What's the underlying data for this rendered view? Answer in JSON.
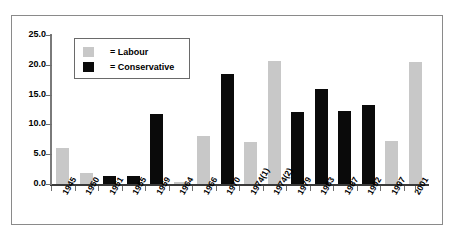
{
  "chart_data": {
    "type": "bar",
    "title": "",
    "subtitle": "",
    "xlabel": "",
    "ylabel": "",
    "ylim": [
      0,
      25
    ],
    "ytick_labels": [
      "25.0",
      "20.0",
      "15.0",
      "10.0",
      "5.0",
      "0.0"
    ],
    "ytick_values": [
      25,
      20,
      15,
      10,
      5,
      0
    ],
    "grid": false,
    "legend_position": "upper-left-inset",
    "categories": [
      "1945",
      "1950",
      "1951",
      "1955",
      "1959",
      "1964",
      "1966",
      "1970",
      "1974(1)",
      "1974(2)",
      "1979",
      "1983",
      "1987",
      "1992",
      "1997",
      "2001"
    ],
    "legend": [
      {
        "label": "= Labour",
        "name": "Labour",
        "color": "#c8c8c8"
      },
      {
        "label": "= Conservative",
        "name": "Conservative",
        "color": "#0a0a0a"
      }
    ],
    "bars": [
      {
        "category": "1945",
        "value": 6.0,
        "party": "Labour"
      },
      {
        "category": "1950",
        "value": 1.9,
        "party": "Labour"
      },
      {
        "category": "1951",
        "value": 1.3,
        "party": "Conservative"
      },
      {
        "category": "1955",
        "value": 1.3,
        "party": "Conservative"
      },
      {
        "category": "1959",
        "value": 11.8,
        "party": "Conservative"
      },
      {
        "category": "1964",
        "value": 0.3,
        "party": "Labour"
      },
      {
        "category": "1966",
        "value": 8.1,
        "party": "Labour"
      },
      {
        "category": "1970",
        "value": 18.5,
        "party": "Conservative"
      },
      {
        "category": "1974(1)",
        "value": 7.1,
        "party": "Labour"
      },
      {
        "category": "1974(2)",
        "value": 20.6,
        "party": "Labour"
      },
      {
        "category": "1979",
        "value": 12.0,
        "party": "Conservative"
      },
      {
        "category": "1983",
        "value": 15.9,
        "party": "Conservative"
      },
      {
        "category": "1987",
        "value": 12.3,
        "party": "Conservative"
      },
      {
        "category": "1992",
        "value": 13.2,
        "party": "Conservative"
      },
      {
        "category": "1997",
        "value": 7.2,
        "party": "Labour"
      },
      {
        "category": "2001",
        "value": 20.4,
        "party": "Labour"
      }
    ],
    "colors": {
      "labour": "#c8c8c8",
      "conservative": "#0a0a0a",
      "axis": "#3a3a3a",
      "border": "#8a8a8a",
      "background": "#ffffff"
    }
  }
}
